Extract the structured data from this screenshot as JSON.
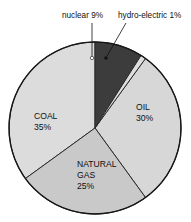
{
  "chart_data": {
    "type": "pie",
    "title": "",
    "subtitle": "",
    "xlabel": "",
    "ylabel": "",
    "legend_position": "none",
    "grid": false,
    "units": "percent",
    "total": 100,
    "categories": [
      "COAL",
      "OIL",
      "NATURAL GAS",
      "nuclear",
      "hydro-electric"
    ],
    "values": [
      35,
      30,
      25,
      9,
      1
    ],
    "slices": [
      {
        "name": "nuclear",
        "label_text": "nuclear 9%",
        "label_lines": [
          "nuclear 9%"
        ],
        "value": 9,
        "value_text": "9%",
        "color": "#3c3c3c",
        "label_placement": "callout-above",
        "label_x": 62,
        "label_y": 18,
        "leader_from_x": 92,
        "leader_from_y": 23,
        "leader_to_x": 92,
        "leader_to_y": 57,
        "dot_x": 92,
        "dot_y": 58
      },
      {
        "name": "hydro-electric",
        "label_text": "hydro-electric 1%",
        "label_lines": [
          "hydro-electric 1%"
        ],
        "value": 1,
        "value_text": "1%",
        "color": "#dedede",
        "label_placement": "callout-above",
        "label_x": 118,
        "label_y": 18,
        "leader_from_x": 126,
        "leader_from_y": 23,
        "leader_to_x": 107,
        "leader_to_y": 56,
        "dot_x": 106,
        "dot_y": 58
      },
      {
        "name": "OIL",
        "label_text": "OIL 30%",
        "label_lines": [
          "OIL",
          "30%"
        ],
        "value": 30,
        "value_text": "30%",
        "color": "#d7d7d7",
        "label_placement": "inside",
        "label_x": 136,
        "label_y": 110
      },
      {
        "name": "NATURAL GAS",
        "label_text": "NATURAL GAS 25%",
        "label_lines": [
          "NATURAL",
          "GAS",
          "25%"
        ],
        "value": 25,
        "value_text": "25%",
        "color": "#c9c9c9",
        "label_placement": "inside",
        "label_x": 77,
        "label_y": 167
      },
      {
        "name": "COAL",
        "label_text": "COAL 35%",
        "label_lines": [
          "COAL",
          "35%"
        ],
        "value": 35,
        "value_text": "35%",
        "color": "#dcdcdc",
        "label_placement": "inside",
        "label_x": 34,
        "label_y": 119
      }
    ],
    "geometry": {
      "center_x": 95,
      "center_y": 128,
      "radius": 86,
      "start_angle_deg": -90,
      "direction": "clockwise"
    },
    "style": {
      "outline_color": "#161616",
      "outline_width": 1.4,
      "divider_color": "#2a2a2a",
      "divider_width": 1,
      "background": "#ffffff",
      "text_color": "#101010"
    }
  }
}
